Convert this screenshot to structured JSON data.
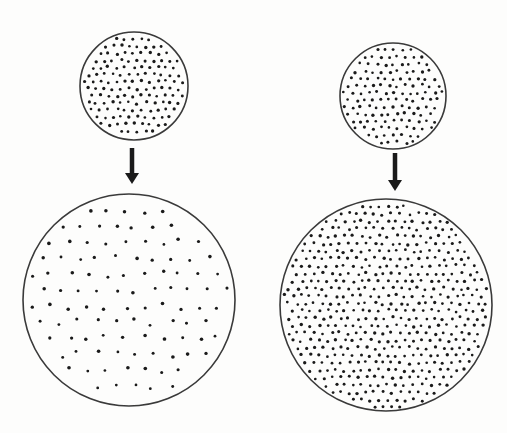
{
  "figure": {
    "background": "#fdfdfc",
    "ink": "#1a1a1a",
    "outline": "#3a3a3a"
  },
  "panels": [
    {
      "id": "left",
      "description": "expansion with fixed number of points (density decreases)",
      "small_circle": {
        "cx": 134,
        "cy": 86,
        "r": 54,
        "dot_spacing": 8.2,
        "dot_r": 1.5
      },
      "arrow": {
        "x": 132,
        "y1": 148,
        "y2": 184
      },
      "large_circle": {
        "cx": 129,
        "cy": 300,
        "r": 106,
        "dot_spacing": 18.5,
        "dot_r": 1.6
      }
    },
    {
      "id": "right",
      "description": "expansion with constant density (more points)",
      "small_circle": {
        "cx": 393,
        "cy": 96,
        "r": 53,
        "dot_spacing": 8.2,
        "dot_r": 1.5
      },
      "arrow": {
        "x": 395,
        "y1": 153,
        "y2": 191
      },
      "large_circle": {
        "cx": 386,
        "cy": 305,
        "r": 106,
        "dot_spacing": 8.6,
        "dot_r": 1.5
      }
    }
  ]
}
